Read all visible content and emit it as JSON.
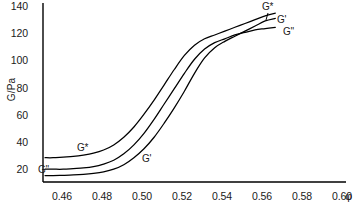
{
  "chart_data": {
    "type": "line",
    "title": "",
    "xlabel": "φ",
    "ylabel": "G/Pa",
    "xlim": [
      0.455,
      0.605
    ],
    "ylim": [
      0,
      140
    ],
    "grid": false,
    "legend": "inline-curve-labels",
    "xticks": [
      "0.46",
      "0.48",
      "0.50",
      "0.52",
      "0.54",
      "0.56",
      "0.58",
      "0.60"
    ],
    "xtick_values": [
      0.46,
      0.48,
      0.5,
      0.52,
      0.54,
      0.56,
      0.58,
      0.6
    ],
    "yticks": [
      "20",
      "40",
      "60",
      "80",
      "100",
      "120",
      "140"
    ],
    "ytick_values": [
      20,
      40,
      60,
      80,
      100,
      120,
      140
    ],
    "series": [
      {
        "name": "G*",
        "label_start": "G*",
        "label_end": "G*",
        "x": [
          0.456,
          0.46,
          0.465,
          0.47,
          0.475,
          0.48,
          0.485,
          0.49,
          0.495,
          0.5,
          0.505,
          0.51,
          0.515,
          0.52,
          0.525,
          0.53,
          0.535,
          0.54,
          0.545,
          0.55,
          0.555,
          0.56,
          0.565,
          0.57
        ],
        "y": [
          19,
          19,
          19.5,
          20,
          21,
          22.5,
          25,
          29,
          35,
          43,
          53,
          64,
          76,
          88,
          99,
          107,
          112,
          115,
          118,
          121,
          124,
          127,
          130,
          132
        ]
      },
      {
        "name": "G''",
        "label_start": "G''",
        "label_end": "G''",
        "x": [
          0.456,
          0.46,
          0.465,
          0.47,
          0.475,
          0.48,
          0.485,
          0.49,
          0.495,
          0.5,
          0.505,
          0.51,
          0.515,
          0.52,
          0.525,
          0.53,
          0.535,
          0.54,
          0.545,
          0.55,
          0.555,
          0.56,
          0.565,
          0.57
        ],
        "y": [
          10,
          10,
          10,
          10.5,
          11,
          12,
          14,
          17,
          22,
          29,
          38,
          49,
          61,
          73,
          85,
          96,
          104,
          109,
          112,
          115,
          117,
          119,
          120,
          121
        ]
      },
      {
        "name": "G'",
        "label_start": "G'",
        "label_end": "G'",
        "x": [
          0.456,
          0.46,
          0.465,
          0.47,
          0.475,
          0.48,
          0.485,
          0.49,
          0.495,
          0.5,
          0.505,
          0.51,
          0.515,
          0.52,
          0.525,
          0.53,
          0.535,
          0.54,
          0.545,
          0.55,
          0.555,
          0.56,
          0.565,
          0.57
        ],
        "y": [
          5,
          5,
          5.2,
          5.5,
          6,
          6.8,
          8,
          10,
          13.5,
          19,
          26,
          35,
          46,
          58,
          71,
          85,
          97,
          105,
          110,
          114,
          118,
          122,
          126,
          128
        ]
      }
    ],
    "annotations": {
      "left_labels": [
        {
          "text": "G*",
          "series": "G*"
        },
        {
          "text": "G''",
          "series": "G''"
        },
        {
          "text": "G'",
          "series": "G'"
        }
      ],
      "right_labels": [
        {
          "text": "G*",
          "series": "G*"
        },
        {
          "text": "G'",
          "series": "G'"
        },
        {
          "text": "G''",
          "series": "G''"
        }
      ]
    },
    "colors": {
      "line": "#000000",
      "axis": "#000000",
      "background": "#ffffff"
    }
  }
}
